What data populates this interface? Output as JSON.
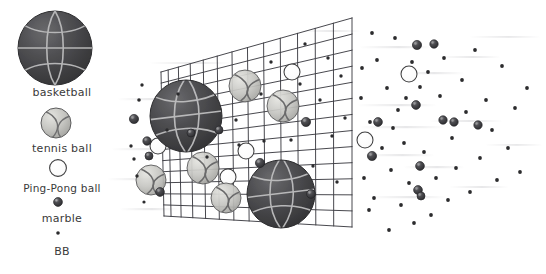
{
  "figure": {
    "background_color": "#ffffff",
    "width": 546,
    "height": 274
  },
  "legend": {
    "items": [
      {
        "key": "basketball",
        "label": "basketball",
        "icon": "basketball-icon",
        "diameter_px": 74,
        "center": {
          "x": 55,
          "y": 48
        },
        "fill": "#4a4a4c",
        "seam_color": "#b9b9ba",
        "passes_screen": false
      },
      {
        "key": "tennis_ball",
        "label": "tennis ball",
        "icon": "tennis-ball-icon",
        "diameter_px": 30,
        "center": {
          "x": 56,
          "y": 123
        },
        "fill": "#c9c9c7",
        "seam_color": "#6f6f70",
        "passes_screen": false
      },
      {
        "key": "ping_pong_ball",
        "label": "Ping-Pong ball",
        "icon": "ping-pong-ball-icon",
        "diameter_px": 17,
        "center": {
          "x": 58,
          "y": 168
        },
        "fill": "#ffffff",
        "seam_color": "#3f3f40",
        "passes_screen": true
      },
      {
        "key": "marble",
        "label": "marble",
        "icon": "marble-icon",
        "diameter_px": 8,
        "center": {
          "x": 58,
          "y": 202
        },
        "fill": "#434345",
        "seam_color": "#8d8d8f",
        "passes_screen": true
      },
      {
        "key": "bb",
        "label": "BB",
        "icon": "bb-icon",
        "diameter_px": 3.4,
        "center": {
          "x": 58,
          "y": 233
        },
        "fill": "#2e2e30",
        "seam_color": "#2e2e30",
        "passes_screen": true
      }
    ]
  },
  "screen": {
    "name": "mesh-screen",
    "line_color": "#33333a",
    "line_width": 0.9,
    "corners": {
      "top_left": {
        "x": 161,
        "y": 72
      },
      "top_right": {
        "x": 352,
        "y": 18
      },
      "bottom_right": {
        "x": 352,
        "y": 227
      },
      "bottom_left": {
        "x": 164,
        "y": 216
      }
    },
    "columns": 13,
    "rows": 13
  },
  "colors": {
    "basketball_fill": "#4a4a4c",
    "basketball_dark": "#3c3c3e",
    "basketball_seam": "#c2c2c3",
    "tennis_fill": "#c7c7c4",
    "tennis_seam": "#6a6a6b",
    "pingpong_fill": "#ffffff",
    "pingpong_outline": "#3f3f40",
    "marble_fill": "#3f3f42",
    "marble_highlight": "#9c9c9e",
    "bb_fill": "#2b2b2d",
    "mesh_line": "#33333a",
    "label_text": "#3a3a3a",
    "streak": "#d8d8da"
  },
  "blocked_balls": [
    {
      "type": "basketball",
      "cx": 186,
      "cy": 116,
      "r": 36
    },
    {
      "type": "basketball",
      "cx": 281,
      "cy": 194,
      "r": 34
    },
    {
      "type": "tennis_ball",
      "cx": 245,
      "cy": 86,
      "r": 16
    },
    {
      "type": "tennis_ball",
      "cx": 283,
      "cy": 106,
      "r": 16
    },
    {
      "type": "tennis_ball",
      "cx": 203,
      "cy": 168,
      "r": 16
    },
    {
      "type": "tennis_ball",
      "cx": 226,
      "cy": 198,
      "r": 15
    },
    {
      "type": "tennis_ball",
      "cx": 151,
      "cy": 180,
      "r": 15
    },
    {
      "type": "ping_pong_ball",
      "cx": 292,
      "cy": 72,
      "r": 8
    },
    {
      "type": "ping_pong_ball",
      "cx": 158,
      "cy": 146,
      "r": 8
    },
    {
      "type": "ping_pong_ball",
      "cx": 246,
      "cy": 151,
      "r": 8
    },
    {
      "type": "ping_pong_ball",
      "cx": 228,
      "cy": 177,
      "r": 8
    }
  ],
  "passed_marbles": [
    {
      "cx": 134,
      "cy": 119,
      "r": 4.6
    },
    {
      "cx": 147,
      "cy": 141,
      "r": 4.2
    },
    {
      "cx": 149,
      "cy": 156,
      "r": 4.0
    },
    {
      "cx": 160,
      "cy": 192,
      "r": 4.4
    },
    {
      "cx": 191,
      "cy": 133,
      "r": 4.0
    },
    {
      "cx": 219,
      "cy": 130,
      "r": 4.0
    },
    {
      "cx": 260,
      "cy": 163,
      "r": 4.6
    },
    {
      "cx": 306,
      "cy": 122,
      "r": 4.6
    },
    {
      "cx": 311,
      "cy": 194,
      "r": 4.4
    },
    {
      "cx": 372,
      "cy": 156,
      "r": 4.6
    },
    {
      "cx": 378,
      "cy": 122,
      "r": 4.4
    },
    {
      "cx": 417,
      "cy": 45,
      "r": 4.6
    },
    {
      "cx": 416,
      "cy": 105,
      "r": 4.4
    },
    {
      "cx": 418,
      "cy": 190,
      "r": 4.4
    },
    {
      "cx": 420,
      "cy": 166,
      "r": 4.4
    },
    {
      "cx": 434,
      "cy": 44,
      "r": 4.2
    },
    {
      "cx": 443,
      "cy": 120,
      "r": 4.2
    },
    {
      "cx": 454,
      "cy": 122,
      "r": 4.2
    },
    {
      "cx": 478,
      "cy": 125,
      "r": 4.2
    },
    {
      "cx": 421,
      "cy": 196,
      "r": 4.0
    }
  ],
  "passed_pingpong": [
    {
      "cx": 409,
      "cy": 74,
      "r": 8
    },
    {
      "cx": 365,
      "cy": 140,
      "r": 8
    }
  ],
  "passed_bbs": [
    {
      "cx": 139,
      "cy": 100,
      "r": 1.8
    },
    {
      "cx": 142,
      "cy": 85,
      "r": 1.7
    },
    {
      "cx": 131,
      "cy": 146,
      "r": 1.7
    },
    {
      "cx": 134,
      "cy": 159,
      "r": 1.7
    },
    {
      "cx": 137,
      "cy": 176,
      "r": 1.7
    },
    {
      "cx": 144,
      "cy": 202,
      "r": 1.6
    },
    {
      "cx": 167,
      "cy": 130,
      "r": 1.7
    },
    {
      "cx": 178,
      "cy": 94,
      "r": 1.7
    },
    {
      "cx": 207,
      "cy": 157,
      "r": 1.7
    },
    {
      "cx": 236,
      "cy": 120,
      "r": 1.7
    },
    {
      "cx": 239,
      "cy": 145,
      "r": 1.7
    },
    {
      "cx": 261,
      "cy": 94,
      "r": 1.7
    },
    {
      "cx": 264,
      "cy": 141,
      "r": 1.7
    },
    {
      "cx": 271,
      "cy": 62,
      "r": 1.7
    },
    {
      "cx": 291,
      "cy": 140,
      "r": 1.7
    },
    {
      "cx": 300,
      "cy": 84,
      "r": 1.7
    },
    {
      "cx": 305,
      "cy": 44,
      "r": 1.7
    },
    {
      "cx": 313,
      "cy": 166,
      "r": 1.7
    },
    {
      "cx": 320,
      "cy": 100,
      "r": 1.7
    },
    {
      "cx": 328,
      "cy": 58,
      "r": 1.7
    },
    {
      "cx": 332,
      "cy": 136,
      "r": 1.7
    },
    {
      "cx": 337,
      "cy": 182,
      "r": 1.7
    },
    {
      "cx": 341,
      "cy": 76,
      "r": 1.7
    },
    {
      "cx": 345,
      "cy": 118,
      "r": 1.7
    },
    {
      "cx": 362,
      "cy": 68,
      "r": 1.9
    },
    {
      "cx": 361,
      "cy": 98,
      "r": 1.9
    },
    {
      "cx": 364,
      "cy": 178,
      "r": 1.9
    },
    {
      "cx": 369,
      "cy": 210,
      "r": 1.9
    },
    {
      "cx": 372,
      "cy": 33,
      "r": 1.9
    },
    {
      "cx": 374,
      "cy": 198,
      "r": 1.9
    },
    {
      "cx": 377,
      "cy": 60,
      "r": 1.9
    },
    {
      "cx": 382,
      "cy": 148,
      "r": 1.9
    },
    {
      "cx": 387,
      "cy": 88,
      "r": 1.9
    },
    {
      "cx": 389,
      "cy": 230,
      "r": 1.9
    },
    {
      "cx": 391,
      "cy": 170,
      "r": 1.9
    },
    {
      "cx": 395,
      "cy": 38,
      "r": 1.9
    },
    {
      "cx": 398,
      "cy": 110,
      "r": 1.9
    },
    {
      "cx": 401,
      "cy": 205,
      "r": 1.9
    },
    {
      "cx": 404,
      "cy": 143,
      "r": 1.9
    },
    {
      "cx": 409,
      "cy": 183,
      "r": 1.9
    },
    {
      "cx": 412,
      "cy": 62,
      "r": 1.9
    },
    {
      "cx": 414,
      "cy": 223,
      "r": 1.9
    },
    {
      "cx": 420,
      "cy": 87,
      "r": 1.9
    },
    {
      "cx": 424,
      "cy": 152,
      "r": 1.9
    },
    {
      "cx": 428,
      "cy": 72,
      "r": 1.9
    },
    {
      "cx": 431,
      "cy": 215,
      "r": 1.9
    },
    {
      "cx": 436,
      "cy": 178,
      "r": 1.9
    },
    {
      "cx": 440,
      "cy": 96,
      "r": 1.9
    },
    {
      "cx": 444,
      "cy": 58,
      "r": 1.9
    },
    {
      "cx": 448,
      "cy": 200,
      "r": 1.9
    },
    {
      "cx": 452,
      "cy": 138,
      "r": 1.9
    },
    {
      "cx": 456,
      "cy": 168,
      "r": 1.9
    },
    {
      "cx": 462,
      "cy": 80,
      "r": 1.9
    },
    {
      "cx": 466,
      "cy": 112,
      "r": 1.9
    },
    {
      "cx": 470,
      "cy": 192,
      "r": 1.9
    },
    {
      "cx": 475,
      "cy": 50,
      "r": 1.9
    },
    {
      "cx": 480,
      "cy": 158,
      "r": 1.9
    },
    {
      "cx": 486,
      "cy": 100,
      "r": 1.9
    },
    {
      "cx": 492,
      "cy": 130,
      "r": 1.9
    },
    {
      "cx": 497,
      "cy": 180,
      "r": 1.9
    },
    {
      "cx": 502,
      "cy": 66,
      "r": 1.9
    },
    {
      "cx": 508,
      "cy": 148,
      "r": 1.9
    },
    {
      "cx": 515,
      "cy": 108,
      "r": 1.9
    },
    {
      "cx": 520,
      "cy": 172,
      "r": 1.9
    },
    {
      "cx": 527,
      "cy": 88,
      "r": 1.9
    },
    {
      "cx": 370,
      "cy": 122,
      "r": 1.9
    },
    {
      "cx": 393,
      "cy": 128,
      "r": 1.9
    },
    {
      "cx": 406,
      "cy": 98,
      "r": 1.9
    }
  ]
}
